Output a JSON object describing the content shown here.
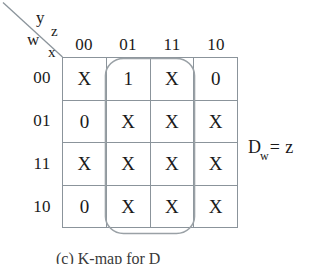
{
  "figure": {
    "type": "karnaugh-map",
    "variable_labels": {
      "top_right_upper": "y",
      "top_right_lower": "z",
      "bottom_left_upper": "w",
      "bottom_left_lower": "x"
    },
    "column_headers": [
      "00",
      "01",
      "11",
      "10"
    ],
    "row_headers": [
      "00",
      "01",
      "11",
      "10"
    ],
    "cells": [
      [
        "X",
        "1",
        "X",
        "0"
      ],
      [
        "0",
        "X",
        "X",
        "X"
      ],
      [
        "X",
        "X",
        "X",
        "X"
      ],
      [
        "0",
        "X",
        "X",
        "X"
      ]
    ],
    "equation": {
      "symbol": "D",
      "subscript": "w",
      "operator": "=",
      "value": "z"
    },
    "caption": "(c)  K-map for D",
    "group_loop": {
      "columns": [
        "01",
        "11"
      ],
      "rows": [
        "00",
        "01",
        "11",
        "10"
      ],
      "color": "#9aa1a6"
    },
    "colors": {
      "grid_line": "#8b949b",
      "text": "#1a1a1a",
      "loop": "#9aa1a6"
    }
  }
}
